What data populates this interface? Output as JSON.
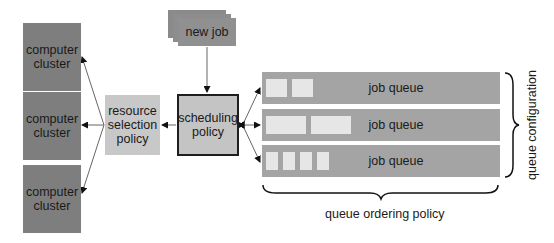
{
  "diagram": {
    "clusters": [
      {
        "label": "computer cluster"
      },
      {
        "label": "computer cluster"
      },
      {
        "label": "computer cluster"
      }
    ],
    "resource_policy": {
      "label": "resource selection policy"
    },
    "scheduling_policy": {
      "label": "scheduling policy"
    },
    "new_job": {
      "label": "new job"
    },
    "queues": [
      {
        "label": "job queue",
        "slots": 2
      },
      {
        "label": "job queue",
        "slots": 2
      },
      {
        "label": "job queue",
        "slots": 4
      }
    ],
    "queue_configuration_label": "queue configuration",
    "queue_ordering_label": "queue ordering policy"
  }
}
